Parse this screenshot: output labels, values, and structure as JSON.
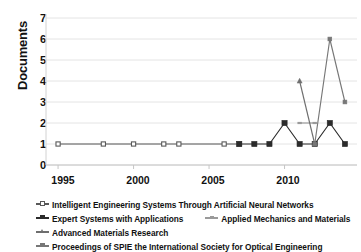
{
  "chart_data": {
    "type": "line",
    "title": "",
    "subtitle": "",
    "xlabel": "",
    "ylabel": "Documents",
    "xlim": [
      1994.2,
      2014.8
    ],
    "ylim": [
      0,
      7
    ],
    "yticks": [
      0,
      1,
      2,
      3,
      4,
      5,
      6,
      7
    ],
    "xticks": [
      1995,
      2000,
      2005,
      2010
    ],
    "xtick_labels": [
      "1995",
      "2000",
      "2005",
      "2010"
    ],
    "grid": "horizontal",
    "legend_position": "bottom-left",
    "series": [
      {
        "name": "Intelligent Engineering Systems Through Artificial Neural Networks",
        "marker": "small-square-open",
        "color": "#595959",
        "x": [
          1995,
          1998,
          2000,
          2002,
          2003,
          2006,
          2007
        ],
        "values": [
          1,
          1,
          1,
          1,
          1,
          1,
          1
        ]
      },
      {
        "name": "Expert Systems with Applications",
        "marker": "filled-square",
        "color": "#2b2b2b",
        "x": [
          2007,
          2008,
          2009,
          2010,
          2011,
          2012,
          2013,
          2014
        ],
        "values": [
          1,
          1,
          1,
          2,
          1,
          1,
          2,
          1
        ]
      },
      {
        "name": "Applied Mechanics and Materials",
        "marker": "small-dash",
        "color": "#9a9a9a",
        "x": [
          2011,
          2012
        ],
        "values": [
          2,
          2
        ]
      },
      {
        "name": "Advanced Materials Research",
        "marker": "small-triangle",
        "color": "#6e6e6e",
        "x": [
          2011,
          2012
        ],
        "values": [
          4,
          1
        ]
      },
      {
        "name": "Proceedings of SPIE the International Society for Optical Engineering",
        "marker": "small-square",
        "color": "#777777",
        "x": [
          2012,
          2013,
          2014
        ],
        "values": [
          1,
          6,
          3
        ]
      }
    ]
  },
  "axes": {
    "ylabel": "Documents",
    "yticks": [
      "0",
      "1",
      "2",
      "3",
      "4",
      "5",
      "6",
      "7"
    ],
    "xticks": [
      "1995",
      "2000",
      "2005",
      "2010"
    ]
  },
  "legend": {
    "rows": [
      [
        {
          "label": "Intelligent Engineering Systems Through Artificial Neural Networks",
          "color": "#595959",
          "marker": "small-square-open"
        }
      ],
      [
        {
          "label": "Expert Systems with Applications",
          "color": "#2b2b2b",
          "marker": "filled-square"
        },
        {
          "label": "Applied Mechanics and Materials",
          "color": "#9a9a9a",
          "marker": "small-dash"
        }
      ],
      [
        {
          "label": "Advanced Materials Research",
          "color": "#6e6e6e",
          "marker": "small-triangle"
        }
      ],
      [
        {
          "label": "Proceedings of SPIE the International Society for Optical Engineering",
          "color": "#777777",
          "marker": "small-square"
        }
      ]
    ]
  }
}
